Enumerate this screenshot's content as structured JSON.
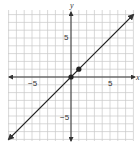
{
  "chart_data": {
    "type": "line",
    "title": "",
    "xlabel": "x",
    "ylabel": "y",
    "xlim": [
      -8,
      8
    ],
    "ylim": [
      -8,
      8.5
    ],
    "grid": true,
    "x_ticks_labeled": [
      -5,
      5
    ],
    "y_ticks_labeled": [
      5,
      -5
    ],
    "tick_labels": {
      "x_neg": "−5",
      "x_pos": "5",
      "y_pos": "5",
      "y_neg": "−5"
    },
    "series": [
      {
        "name": "line y = x",
        "equation": "y = x",
        "x": [
          -8,
          8
        ],
        "y": [
          -8,
          8
        ],
        "arrows_both_ends": true
      }
    ],
    "points": [
      {
        "x": 0,
        "y": 0
      },
      {
        "x": 1,
        "y": 1
      }
    ],
    "colors": {
      "grid": "#c8c8c8",
      "axis": "#333333",
      "line": "#222222"
    }
  }
}
